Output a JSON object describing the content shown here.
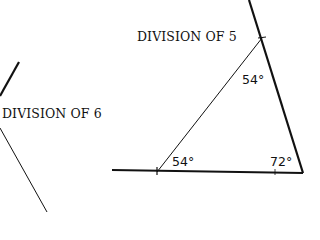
{
  "labels": {
    "division_5": "DIVISION OF 5",
    "division_6": "DIVISION OF 6"
  },
  "angles": {
    "top": "54°",
    "bottom_left": "54°",
    "bottom_right": "72°"
  },
  "colors": {
    "line": "#111111",
    "background": "#ffffff"
  }
}
